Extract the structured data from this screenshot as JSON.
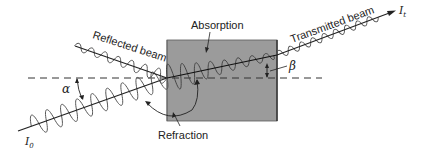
{
  "diagram": {
    "colors": {
      "medium_fill": "#9b9b9b",
      "medium_edge": "#4a4a4a",
      "line": "#222222",
      "wave": "#555555",
      "normal_line": "#333333",
      "background": "#ffffff"
    },
    "labels": {
      "absorption": "Absorption",
      "reflected_beam": "Reflected beam",
      "transmitted_beam": "Transmitted beam",
      "refraction": "Refraction",
      "alpha": "α",
      "beta": "β",
      "incident_intensity": "I",
      "incident_intensity_sub": "0",
      "transmitted_intensity": "I",
      "transmitted_intensity_sub": "t"
    },
    "elements": {
      "medium_box": {
        "x": 167,
        "y": 40,
        "width": 110,
        "height": 81
      },
      "normal_line": {
        "y": 78,
        "x_start": 28,
        "x_end": 322,
        "style": "dashed"
      },
      "incident_beam": {
        "from": [
          18,
          131
        ],
        "to": [
          167,
          78
        ]
      },
      "reflected_beam": {
        "from": [
          167,
          78
        ],
        "to": [
          75,
          46
        ]
      },
      "refracted_beam": {
        "from": [
          167,
          78
        ],
        "to": [
          277,
          55
        ]
      },
      "transmitted_beam": {
        "from": [
          277,
          55
        ],
        "to": [
          392,
          12
        ]
      }
    }
  }
}
